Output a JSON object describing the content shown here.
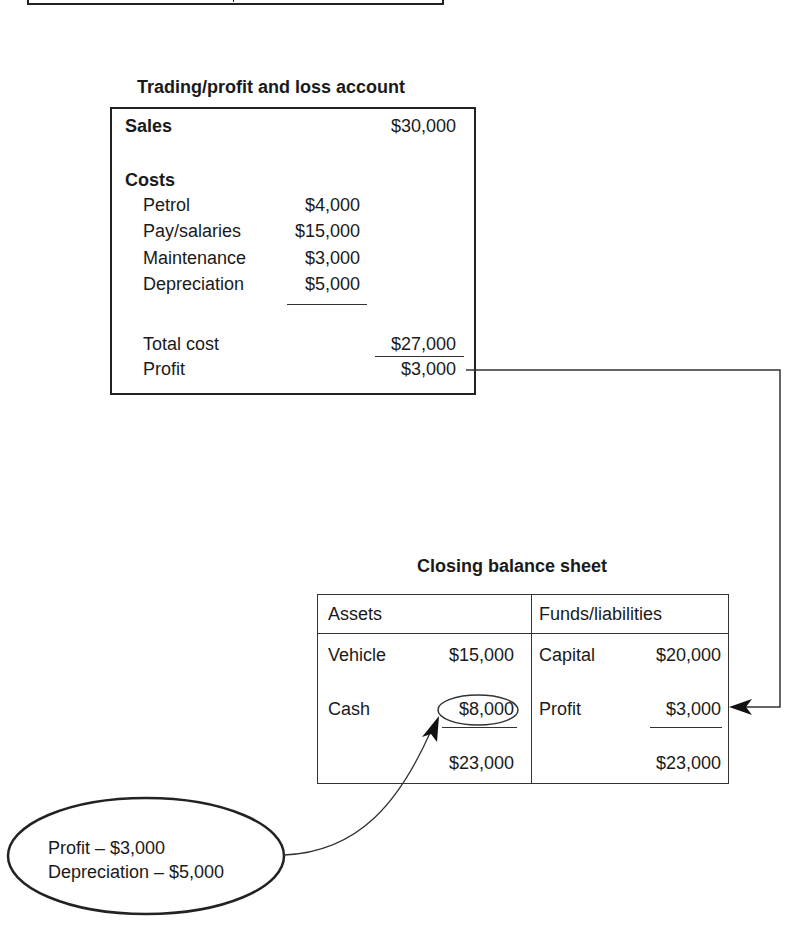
{
  "pl_account": {
    "title": "Trading/profit and loss account",
    "sales": {
      "label": "Sales",
      "value": "$30,000"
    },
    "costs_heading": "Costs",
    "cost_items": [
      {
        "label": "Petrol",
        "value": "$4,000"
      },
      {
        "label": "Pay/salaries",
        "value": "$15,000"
      },
      {
        "label": "Maintenance",
        "value": "$3,000"
      },
      {
        "label": "Depreciation",
        "value": "$5,000"
      }
    ],
    "total_cost": {
      "label": "Total cost",
      "value": "$27,000"
    },
    "profit": {
      "label": "Profit",
      "value": "$3,000"
    }
  },
  "balance_sheet": {
    "title": "Closing balance sheet",
    "assets": {
      "header": "Assets",
      "rows": [
        {
          "label": "Vehicle",
          "value": "$15,000"
        },
        {
          "label": "Cash",
          "value": "$8,000",
          "circled": true
        }
      ],
      "total": "$23,000"
    },
    "liabilities": {
      "header": "Funds/liabilities",
      "rows": [
        {
          "label": "Capital",
          "value": "$20,000"
        },
        {
          "label": "Profit",
          "value": "$3,000"
        }
      ],
      "total": "$23,000"
    }
  },
  "callout": {
    "lines": [
      "Profit – $3,000",
      "Depreciation – $5,000"
    ]
  },
  "connectors": [
    {
      "from": "pl_account.profit",
      "to": "balance_sheet.liabilities.profit"
    },
    {
      "from": "callout",
      "to": "balance_sheet.assets.cash"
    }
  ]
}
